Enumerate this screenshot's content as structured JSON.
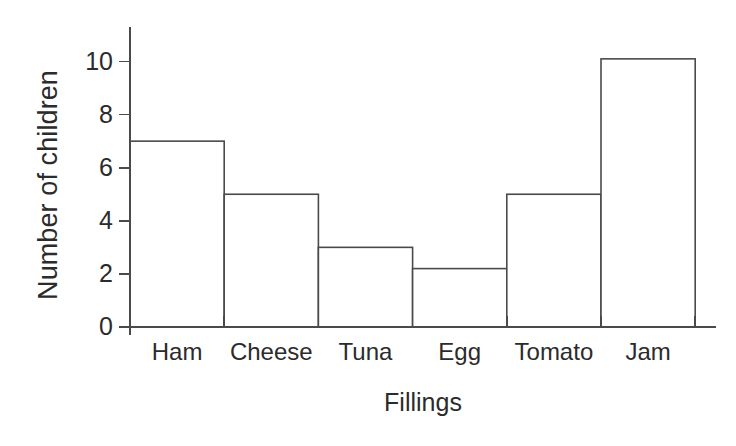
{
  "chart_data": {
    "type": "bar",
    "title": "",
    "xlabel": "Fillings",
    "ylabel": "Number of children",
    "categories": [
      "Ham",
      "Cheese",
      "Tuna",
      "Egg",
      "Tomato",
      "Jam"
    ],
    "values": [
      7,
      5,
      3,
      2.2,
      5,
      10.1
    ],
    "series": [
      {
        "name": "Number of children",
        "values": [
          7,
          5,
          3,
          2.2,
          5,
          10.1
        ]
      }
    ],
    "ylim": [
      0,
      11.3
    ],
    "xlim": [
      0,
      6
    ],
    "y_ticks": [
      0,
      2,
      4,
      6,
      8,
      10
    ],
    "y_tick_labels": [
      "0",
      "2",
      "4",
      "6",
      "8",
      "10"
    ],
    "grid": false,
    "legend": false,
    "legend_position": "none",
    "bar_gap": 0,
    "bar_fill_color": "#ffffff",
    "bar_edge_color": "#4a4a4a",
    "axis_color": "#4a4a4a",
    "background_color": "#ffffff",
    "text_color": "#2b2b2b",
    "annotations": []
  },
  "axes": {
    "y_title": "Number of children",
    "x_title": "Fillings"
  }
}
